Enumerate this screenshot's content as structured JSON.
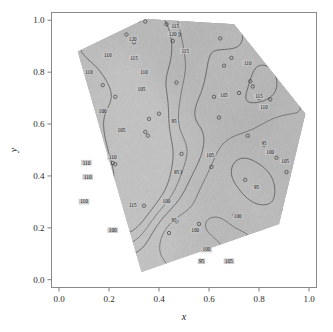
{
  "figure": {
    "kind": "contour-map",
    "background": "#ffffff",
    "frame_color": "#808080"
  },
  "axes": {
    "x": {
      "label": "x",
      "ticks": [
        "0.0",
        "0.2",
        "0.4",
        "0.6",
        "0.8",
        "1.0"
      ],
      "tick_values": [
        0.0,
        0.2,
        0.4,
        0.6,
        0.8,
        1.0
      ],
      "range": [
        -0.03,
        1.03
      ]
    },
    "y": {
      "label": "y",
      "ticks": [
        "0.0",
        "0.2",
        "0.4",
        "0.6",
        "0.8",
        "1.0"
      ],
      "tick_values": [
        0.0,
        0.2,
        0.4,
        0.6,
        0.8,
        1.0
      ],
      "range": [
        -0.03,
        1.03
      ]
    }
  },
  "chart_data": {
    "type": "heatmap",
    "title": "",
    "xlabel": "x",
    "ylabel": "y",
    "xlim": [
      -0.03,
      1.03
    ],
    "ylim": [
      -0.03,
      1.03
    ],
    "grid": false,
    "legend": "none",
    "colormap": "gray",
    "value_range": [
      92,
      122
    ],
    "contour_levels": [
      95,
      100,
      105,
      110,
      115,
      120
    ],
    "contour_interval": 5,
    "contour_labels": [
      {
        "text": "120",
        "x": 0.295,
        "y": 0.925
      },
      {
        "text": "120",
        "x": 0.455,
        "y": 0.945
      },
      {
        "text": "115",
        "x": 0.465,
        "y": 0.975
      },
      {
        "text": "115",
        "x": 0.3,
        "y": 0.855
      },
      {
        "text": "115",
        "x": 0.505,
        "y": 0.88
      },
      {
        "text": "110",
        "x": 0.195,
        "y": 0.865
      },
      {
        "text": "110",
        "x": 0.12,
        "y": 0.8
      },
      {
        "text": "110",
        "x": 0.34,
        "y": 0.8
      },
      {
        "text": "110",
        "x": 0.755,
        "y": 0.835
      },
      {
        "text": "105",
        "x": 0.33,
        "y": 0.735
      },
      {
        "text": "100",
        "x": 0.175,
        "y": 0.65
      },
      {
        "text": "115",
        "x": 0.8,
        "y": 0.705
      },
      {
        "text": "110",
        "x": 0.82,
        "y": 0.665
      },
      {
        "text": "105",
        "x": 0.66,
        "y": 0.71
      },
      {
        "text": "105",
        "x": 0.25,
        "y": 0.575
      },
      {
        "text": "95",
        "x": 0.46,
        "y": 0.61
      },
      {
        "text": "110",
        "x": 0.215,
        "y": 0.47
      },
      {
        "text": "105",
        "x": 0.605,
        "y": 0.48
      },
      {
        "text": "95",
        "x": 0.47,
        "y": 0.415
      },
      {
        "text": "110",
        "x": 0.11,
        "y": 0.45
      },
      {
        "text": "110",
        "x": 0.115,
        "y": 0.395
      },
      {
        "text": "100",
        "x": 0.845,
        "y": 0.49
      },
      {
        "text": "105",
        "x": 0.905,
        "y": 0.455
      },
      {
        "text": "95",
        "x": 0.82,
        "y": 0.525
      },
      {
        "text": "95",
        "x": 0.79,
        "y": 0.355
      },
      {
        "text": "115",
        "x": 0.295,
        "y": 0.285
      },
      {
        "text": "110",
        "x": 0.1,
        "y": 0.3
      },
      {
        "text": "100",
        "x": 0.43,
        "y": 0.3
      },
      {
        "text": "95",
        "x": 0.46,
        "y": 0.23
      },
      {
        "text": "100",
        "x": 0.545,
        "y": 0.19
      },
      {
        "text": "100",
        "x": 0.215,
        "y": 0.19
      },
      {
        "text": "100",
        "x": 0.715,
        "y": 0.245
      },
      {
        "text": "100",
        "x": 0.59,
        "y": 0.115
      },
      {
        "text": "95",
        "x": 0.57,
        "y": 0.07
      },
      {
        "text": "105",
        "x": 0.68,
        "y": 0.07
      }
    ],
    "domain_shape": "hexagon",
    "domain_vertices": [
      [
        0.075,
        0.88
      ],
      [
        0.345,
        1.005
      ],
      [
        0.7,
        0.985
      ],
      [
        0.985,
        0.64
      ],
      [
        0.88,
        0.215
      ],
      [
        0.33,
        0.03
      ]
    ],
    "sample_points": [
      [
        0.045,
        0.87
      ],
      [
        0.02,
        0.505
      ],
      [
        0.01,
        0.275
      ],
      [
        0.065,
        0.745
      ],
      [
        0.075,
        0.69
      ],
      [
        0.085,
        0.66
      ],
      [
        0.175,
        0.75
      ],
      [
        0.18,
        0.65
      ],
      [
        0.165,
        0.51
      ],
      [
        0.215,
        0.45
      ],
      [
        0.225,
        0.445
      ],
      [
        0.27,
        0.945
      ],
      [
        0.3,
        0.915
      ],
      [
        0.3,
        1.0
      ],
      [
        0.32,
        1.0
      ],
      [
        0.345,
        0.995
      ],
      [
        0.225,
        0.705
      ],
      [
        0.345,
        0.57
      ],
      [
        0.355,
        0.555
      ],
      [
        0.36,
        0.62
      ],
      [
        0.4,
        0.64
      ],
      [
        0.34,
        0.285
      ],
      [
        0.43,
        0.985
      ],
      [
        0.465,
        0.975
      ],
      [
        0.48,
        0.945
      ],
      [
        0.455,
        0.92
      ],
      [
        0.47,
        0.76
      ],
      [
        0.49,
        0.485
      ],
      [
        0.485,
        0.415
      ],
      [
        0.47,
        0.225
      ],
      [
        0.44,
        0.18
      ],
      [
        0.56,
        0.215
      ],
      [
        0.575,
        0.07
      ],
      [
        0.595,
        0.105
      ],
      [
        0.61,
        0.435
      ],
      [
        0.62,
        0.705
      ],
      [
        0.64,
        0.625
      ],
      [
        0.645,
        0.93
      ],
      [
        0.66,
        0.825
      ],
      [
        0.69,
        0.855
      ],
      [
        0.7,
        0.02
      ],
      [
        0.7,
        0.25
      ],
      [
        0.705,
        0.04
      ],
      [
        0.72,
        0.72
      ],
      [
        0.745,
        0.385
      ],
      [
        0.755,
        0.555
      ],
      [
        0.765,
        0.765
      ],
      [
        0.775,
        0.745
      ],
      [
        0.79,
        0.355
      ],
      [
        0.8,
        0.7
      ],
      [
        0.82,
        0.52
      ],
      [
        0.845,
        0.695
      ],
      [
        0.87,
        0.47
      ],
      [
        0.9,
        0.265
      ],
      [
        0.91,
        0.415
      ],
      [
        0.93,
        0.375
      ],
      [
        0.935,
        0.22
      ],
      [
        0.94,
        0.81
      ]
    ],
    "peaks": [
      {
        "label": "central maximum",
        "x": 0.35,
        "y": 0.57,
        "value": 122
      },
      {
        "label": "upper ridge",
        "x": 0.295,
        "y": 0.92,
        "value": 121
      },
      {
        "label": "left lobe",
        "x": 0.295,
        "y": 0.28,
        "value": 117
      }
    ]
  }
}
